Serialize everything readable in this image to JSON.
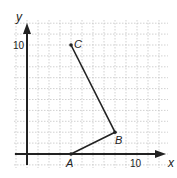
{
  "diagram": {
    "type": "coordinate_plane",
    "axes": {
      "x_label": "x",
      "y_label": "y",
      "x_tick_label": "10",
      "y_tick_label": "10",
      "x_range": [
        -1,
        12
      ],
      "y_range": [
        -1,
        12
      ]
    },
    "points": [
      {
        "name": "A",
        "x": 4,
        "y": 0
      },
      {
        "name": "B",
        "x": 8,
        "y": 2
      },
      {
        "name": "C",
        "x": 4,
        "y": 10
      }
    ],
    "segments": [
      [
        "A",
        "B"
      ],
      [
        "B",
        "C"
      ]
    ],
    "colors": {
      "grid": "#bdbdbd",
      "axis": "#222222",
      "line": "#222222"
    }
  }
}
